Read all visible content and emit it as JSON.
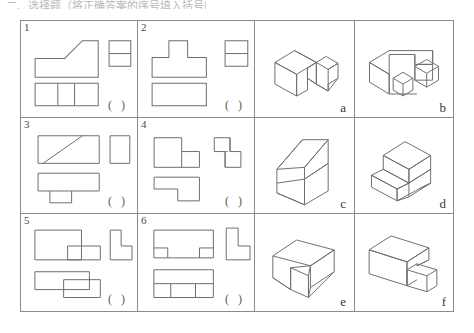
{
  "page": {
    "top_text": "二、选择题（将正确答案的序号填入括号内）",
    "answer_blank": "（ ）"
  },
  "table": {
    "columns": 4,
    "rows": 3,
    "projection_cells": [
      {
        "number": "1",
        "blank": "( )",
        "description": "three-view drawing: front view rectangle with chamfer rising left-to-right, side view rectangle split by one horizontal line, top view rectangle split into three vertical panels",
        "views": {
          "front": "stepped-block-with-inclined-face",
          "side": "rectangle-split-horizontally",
          "top": "rectangle-split-into-three"
        }
      },
      {
        "number": "2",
        "blank": "( )",
        "description": "three-view drawing: front view T-shape, side view rectangle split by one horizontal line, top view plain rectangle",
        "views": {
          "front": "t-shape",
          "side": "rectangle-split-horizontally",
          "top": "plain-rectangle"
        }
      },
      {
        "number": "3",
        "blank": "( )",
        "description": "three-view drawing: front view rectangle with diagonal line, side view plain rectangle, top view rectangle with lower notch block",
        "views": {
          "front": "rectangle-with-diagonal",
          "side": "plain-rectangle",
          "top": "rectangle-with-lower-block"
        }
      },
      {
        "number": "4",
        "blank": "( )",
        "description": "three-view drawing: front view L-shape step, side view stacked squares with hidden dashed line, top view Z-shaped outline",
        "views": {
          "front": "l-shape-step",
          "side": "stacked-squares-with-dashed-line",
          "top": "z-shape"
        }
      },
      {
        "number": "5",
        "blank": "( )",
        "description": "three-view drawing: front view large rectangle with smaller rectangle at lower right, side view L-shape, top view two overlapping offset rectangles",
        "views": {
          "front": "rectangle-with-lower-right-block",
          "side": "l-shape",
          "top": "two-offset-rectangles"
        }
      },
      {
        "number": "6",
        "blank": "( )",
        "description": "three-view drawing: front view rectangle with two bottom corner notches, side view L-shape, top view rectangle divided into three lower cells",
        "views": {
          "front": "rectangle-with-two-bottom-notches",
          "side": "l-shape",
          "top": "rectangle-with-three-lower-cells"
        }
      }
    ],
    "pictorial_cells": [
      {
        "letter": "a",
        "description": "isometric block with rectangular notch cut out of the right front, forming a step"
      },
      {
        "letter": "b",
        "description": "isometric U-shaped channel block with two small cubes sitting inside the channel"
      },
      {
        "letter": "c",
        "description": "isometric wedge block with a large inclined ramp face rising to the rear"
      },
      {
        "letter": "d",
        "description": "isometric stepped block, raised rectangular portion at the rear left above a lower slab"
      },
      {
        "letter": "e",
        "description": "isometric rectangular block with a diagonal V-groove cut across the top face"
      },
      {
        "letter": "f",
        "description": "isometric tall rectangular block with a smaller cube attached at the lower right front"
      }
    ]
  }
}
